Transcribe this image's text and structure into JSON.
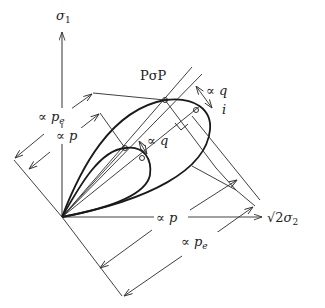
{
  "diagram": {
    "axes": {
      "vertical": {
        "symbol": "σ",
        "subscript": "1"
      },
      "horizontal": {
        "prefix": "√2",
        "symbol": "σ",
        "subscript": "2"
      },
      "diagonal": {
        "symbol": "i"
      }
    },
    "title": "PσP",
    "labels": {
      "prop": "∝",
      "p": "p",
      "pe_base": "p",
      "pe_sub": "e",
      "q": "q"
    },
    "dimensions": [
      {
        "id": "left-outer",
        "text": "∝ pe"
      },
      {
        "id": "left-inner",
        "text": "∝ p"
      },
      {
        "id": "bottom-inner",
        "text": "∝ p"
      },
      {
        "id": "bottom-outer",
        "text": "∝ pe"
      },
      {
        "id": "q-outer",
        "text": "∝ q"
      },
      {
        "id": "q-inner",
        "text": "∝ q"
      }
    ],
    "colors": {
      "line": "#222222",
      "background": "#ffffff"
    }
  }
}
